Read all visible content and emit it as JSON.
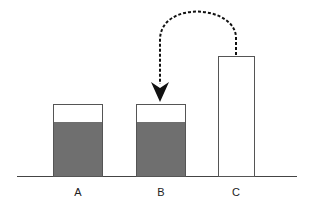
{
  "diagram": {
    "containers": [
      {
        "label": "A",
        "fill_level": "partially filled",
        "fill_color": "#6f6f6f"
      },
      {
        "label": "B",
        "fill_level": "partially filled",
        "fill_color": "#6f6f6f"
      },
      {
        "label": "C",
        "fill_level": "empty",
        "fill_color": "#ffffff"
      }
    ],
    "arrow": {
      "from": "C",
      "to": "B",
      "style": "dashed curved"
    }
  }
}
